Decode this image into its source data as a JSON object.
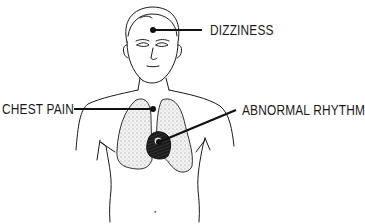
{
  "diagram": {
    "labels": [
      {
        "id": "dizziness",
        "text": "DIZZINESS",
        "points_to": "head"
      },
      {
        "id": "chest-pain",
        "text": "CHEST PAIN",
        "points_to": "chest"
      },
      {
        "id": "abnormal-rhythm",
        "text": "ABNORMAL RHYTHM",
        "points_to": "heart"
      }
    ],
    "colors": {
      "ink": "#1a1a1a",
      "background": "#ffffff",
      "lung_fill": "#e6e6e6"
    }
  }
}
